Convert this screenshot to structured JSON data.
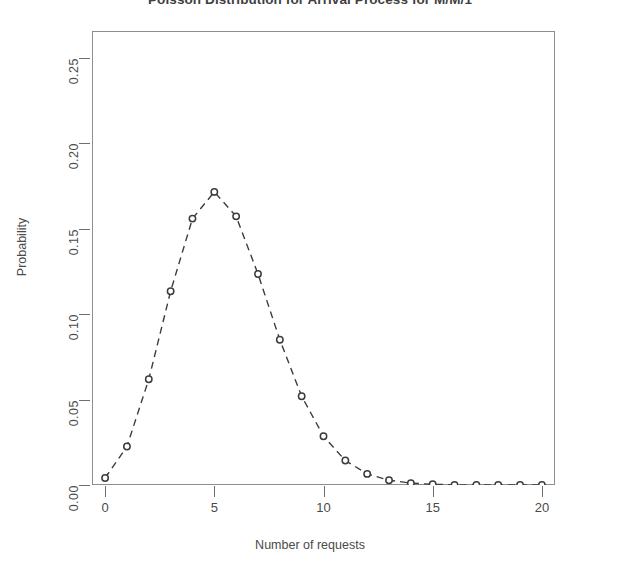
{
  "chart_data": {
    "type": "line",
    "title": "Poisson Distribution for Arrival Process for M/M/1",
    "xlabel": "Number of requests",
    "ylabel": "Probability",
    "xlim": [
      -0.6,
      20.6
    ],
    "ylim": [
      0.0,
      0.2655
    ],
    "grid": false,
    "legend": null,
    "marker": "open-circle",
    "linestyle": "dashed",
    "color": "#3c3c3c",
    "lambda": 5.5,
    "x_ticks": [
      0,
      5,
      10,
      15,
      20
    ],
    "x_tick_labels": [
      "0",
      "5",
      "10",
      "15",
      "20"
    ],
    "y_ticks": [
      0.0,
      0.05,
      0.1,
      0.15,
      0.2,
      0.25
    ],
    "y_tick_labels": [
      "0.00",
      "0.05",
      "0.10",
      "0.15",
      "0.20",
      "0.25"
    ],
    "x": [
      0,
      1,
      2,
      3,
      4,
      5,
      6,
      7,
      8,
      9,
      10,
      11,
      12,
      13,
      14,
      15,
      16,
      17,
      18,
      19,
      20
    ],
    "values": [
      0.0041,
      0.0225,
      0.0618,
      0.1133,
      0.1558,
      0.1714,
      0.1571,
      0.1234,
      0.0849,
      0.0519,
      0.0285,
      0.0143,
      0.0065,
      0.0028,
      0.0011,
      0.0004,
      0.0001,
      0.0,
      0.0,
      0.0,
      0.0
    ],
    "series": [
      {
        "name": "Poisson pmf",
        "values": [
          0.0041,
          0.0225,
          0.0618,
          0.1133,
          0.1558,
          0.1714,
          0.1571,
          0.1234,
          0.0849,
          0.0519,
          0.0285,
          0.0143,
          0.0065,
          0.0028,
          0.0011,
          0.0004,
          0.0001,
          0.0,
          0.0,
          0.0,
          0.0
        ]
      }
    ]
  }
}
